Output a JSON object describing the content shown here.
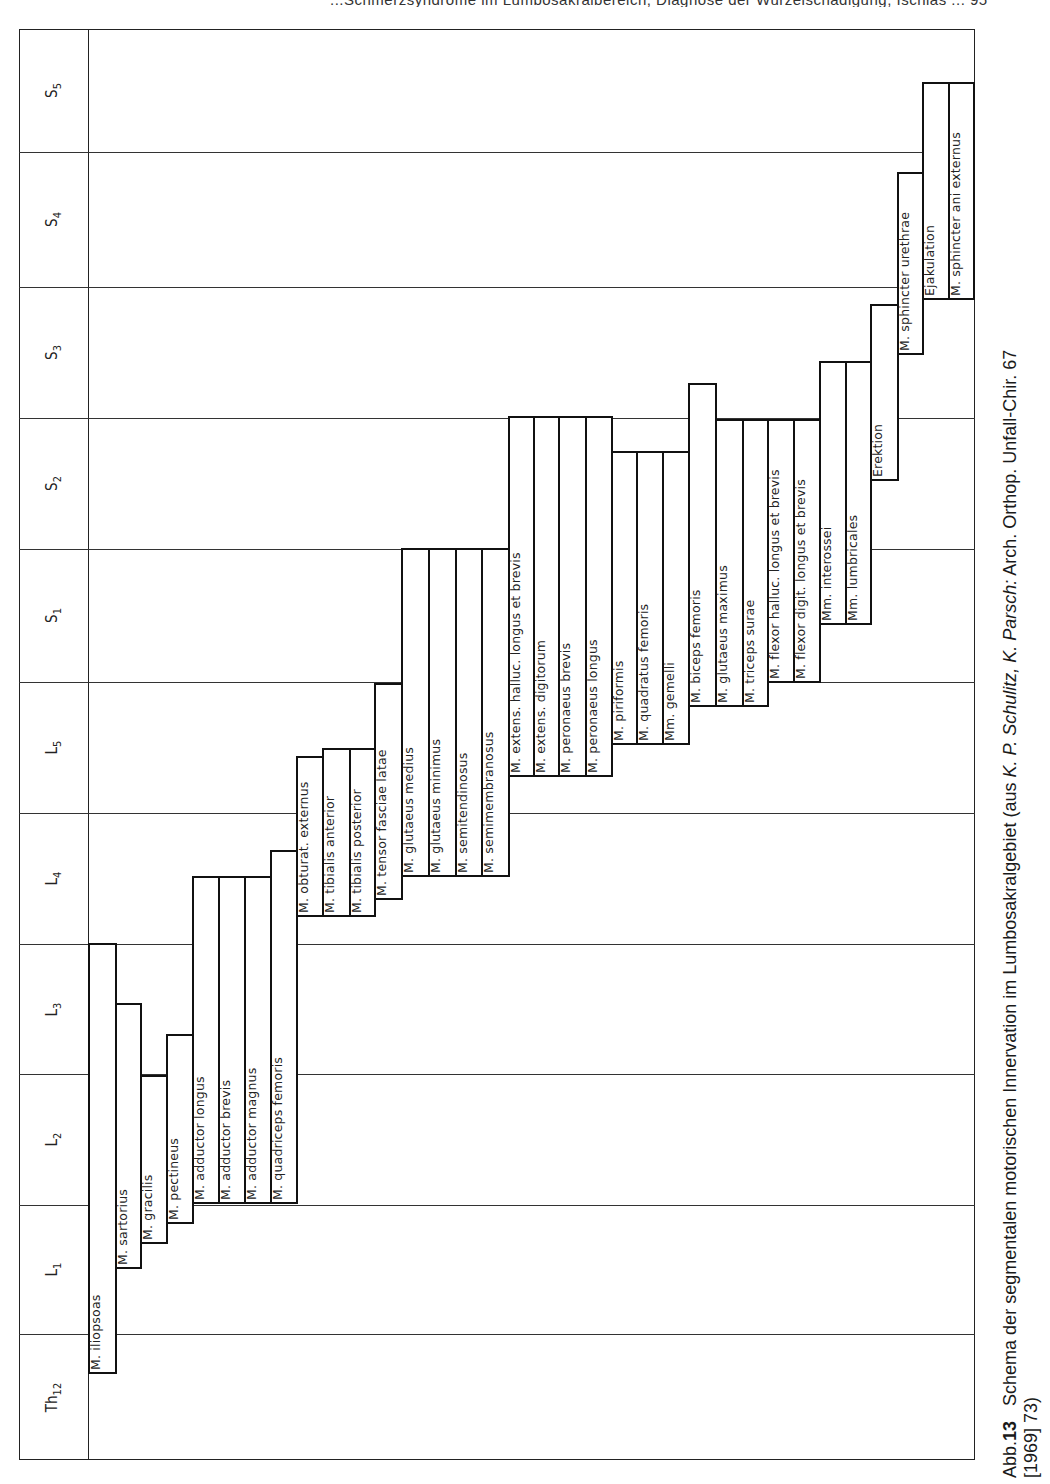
{
  "header": {
    "partial_text": "...Schmerzsyndrome im Lumbosakralbereich, Diagnose der Wurzelschädigung, Ischias ... 95"
  },
  "frame": {
    "left": 19,
    "top": 29,
    "right": 975,
    "bottom": 1460,
    "label_col_right": 88
  },
  "segments": [
    {
      "id": "S5",
      "base": "S",
      "sub": "5",
      "top": 29,
      "bottom": 152
    },
    {
      "id": "S4",
      "base": "S",
      "sub": "4",
      "top": 152,
      "bottom": 287
    },
    {
      "id": "S3",
      "base": "S",
      "sub": "3",
      "top": 287,
      "bottom": 418
    },
    {
      "id": "S2",
      "base": "S",
      "sub": "2",
      "top": 418,
      "bottom": 549
    },
    {
      "id": "S1",
      "base": "S",
      "sub": "1",
      "top": 549,
      "bottom": 682
    },
    {
      "id": "L5",
      "base": "L",
      "sub": "5",
      "top": 682,
      "bottom": 813
    },
    {
      "id": "L4",
      "base": "L",
      "sub": "4",
      "top": 813,
      "bottom": 944
    },
    {
      "id": "L3",
      "base": "L",
      "sub": "3",
      "top": 944,
      "bottom": 1074
    },
    {
      "id": "L2",
      "base": "L",
      "sub": "2",
      "top": 1074,
      "bottom": 1205
    },
    {
      "id": "L1",
      "base": "L",
      "sub": "1",
      "top": 1205,
      "bottom": 1334
    },
    {
      "id": "Th12",
      "base": "Th",
      "sub": "12",
      "top": 1334,
      "bottom": 1460
    }
  ],
  "chart_data": {
    "type": "table",
    "title": "Schema der segmentalen motorischen Innervation im Lumbosakralgebiet",
    "axis": "Rückenmarkssegmente (Th12 unten bis S5 oben)",
    "segments_order": [
      "Th12",
      "L1",
      "L2",
      "L3",
      "L4",
      "L5",
      "S1",
      "S2",
      "S3",
      "S4",
      "S5"
    ],
    "muscles": [
      {
        "name": "M. iliopsoas",
        "x": 88,
        "w": 27,
        "top": 943,
        "bottom": 1374,
        "from": "Th12",
        "to": "L3"
      },
      {
        "name": "M. sartorius",
        "x": 115,
        "w": 25,
        "top": 1003,
        "bottom": 1269,
        "from": "L1",
        "to": "L3"
      },
      {
        "name": "M. gracilis",
        "x": 140,
        "w": 26,
        "top": 1075,
        "bottom": 1244,
        "from": "L1",
        "to": "L2"
      },
      {
        "name": "M. pectineus",
        "x": 166,
        "w": 26,
        "top": 1034,
        "bottom": 1224,
        "from": "L1",
        "to": "L3"
      },
      {
        "name": "M. adductor longus",
        "x": 192,
        "w": 26,
        "top": 876,
        "bottom": 1204,
        "from": "L2",
        "to": "L4"
      },
      {
        "name": "M. adductor brevis",
        "x": 218,
        "w": 26,
        "top": 876,
        "bottom": 1204,
        "from": "L2",
        "to": "L4"
      },
      {
        "name": "M. adductor magnus",
        "x": 244,
        "w": 26,
        "top": 876,
        "bottom": 1204,
        "from": "L2",
        "to": "L4"
      },
      {
        "name": "M. quadriceps femoris",
        "x": 270,
        "w": 26,
        "top": 850,
        "bottom": 1204,
        "from": "L2",
        "to": "L4"
      },
      {
        "name": "M. obturat. externus",
        "x": 296,
        "w": 26,
        "top": 756,
        "bottom": 917,
        "from": "L3",
        "to": "L5"
      },
      {
        "name": "M. tibialis anterior",
        "x": 322,
        "w": 27,
        "top": 748,
        "bottom": 917,
        "from": "L3",
        "to": "L5"
      },
      {
        "name": "M. tibialis posterior",
        "x": 349,
        "w": 25,
        "top": 748,
        "bottom": 917,
        "from": "L3",
        "to": "L5"
      },
      {
        "name": "M. tensor fasciae latae",
        "x": 374,
        "w": 27,
        "top": 683,
        "bottom": 900,
        "from": "L4",
        "to": "L5"
      },
      {
        "name": "M. glutaeus medius",
        "x": 401,
        "w": 27,
        "top": 548,
        "bottom": 877,
        "from": "L4",
        "to": "S1"
      },
      {
        "name": "M. glutaeus minimus",
        "x": 428,
        "w": 27,
        "top": 548,
        "bottom": 877,
        "from": "L4",
        "to": "S1"
      },
      {
        "name": "M. semitendinosus",
        "x": 455,
        "w": 26,
        "top": 548,
        "bottom": 877,
        "from": "L4",
        "to": "S1"
      },
      {
        "name": "M. semimembranosus",
        "x": 481,
        "w": 27,
        "top": 548,
        "bottom": 877,
        "from": "L4",
        "to": "S1"
      },
      {
        "name": "M. extens. halluc. longus et brevis",
        "x": 508,
        "w": 25,
        "top": 416,
        "bottom": 777,
        "from": "L5",
        "to": "S2"
      },
      {
        "name": "M. extens. digitorum",
        "x": 533,
        "w": 25,
        "top": 416,
        "bottom": 777,
        "from": "L5",
        "to": "S2"
      },
      {
        "name": "M. peronaeus brevis",
        "x": 558,
        "w": 27,
        "top": 416,
        "bottom": 777,
        "from": "L5",
        "to": "S2"
      },
      {
        "name": "M. peronaeus longus",
        "x": 585,
        "w": 26,
        "top": 416,
        "bottom": 777,
        "from": "L5",
        "to": "S2"
      },
      {
        "name": "M. piriformis",
        "x": 611,
        "w": 25,
        "top": 451,
        "bottom": 745,
        "from": "L5",
        "to": "S2"
      },
      {
        "name": "M. quadratus femoris",
        "x": 636,
        "w": 26,
        "top": 451,
        "bottom": 745,
        "from": "L5",
        "to": "S2"
      },
      {
        "name": "Mm. gemelli",
        "x": 662,
        "w": 26,
        "top": 451,
        "bottom": 745,
        "from": "L5",
        "to": "S2"
      },
      {
        "name": "M. biceps femoris",
        "x": 688,
        "w": 27,
        "top": 383,
        "bottom": 707,
        "from": "L5",
        "to": "S3"
      },
      {
        "name": "M. glutaeus maximus",
        "x": 715,
        "w": 27,
        "top": 419,
        "bottom": 707,
        "from": "L5",
        "to": "S2"
      },
      {
        "name": "M. triceps surae",
        "x": 742,
        "w": 25,
        "top": 419,
        "bottom": 707,
        "from": "L5",
        "to": "S2"
      },
      {
        "name": "M. flexor halluc. longus et brevis",
        "x": 767,
        "w": 26,
        "top": 419,
        "bottom": 683,
        "from": "S1",
        "to": "S2"
      },
      {
        "name": "M. flexor digit. longus et brevis",
        "x": 793,
        "w": 26,
        "top": 419,
        "bottom": 683,
        "from": "S1",
        "to": "S2"
      },
      {
        "name": "Mm. interossei",
        "x": 819,
        "w": 26,
        "top": 361,
        "bottom": 625,
        "from": "S1",
        "to": "S3"
      },
      {
        "name": "Mm. lumbricales",
        "x": 845,
        "w": 25,
        "top": 361,
        "bottom": 625,
        "from": "S1",
        "to": "S3"
      },
      {
        "name": "Erektion",
        "x": 870,
        "w": 27,
        "top": 304,
        "bottom": 481,
        "from": "S2",
        "to": "S3"
      },
      {
        "name": "M. sphincter urethrae",
        "x": 897,
        "w": 25,
        "top": 172,
        "bottom": 355,
        "from": "S3",
        "to": "S4"
      },
      {
        "name": "Ejakulation",
        "x": 922,
        "w": 26,
        "top": 82,
        "bottom": 300,
        "from": "S4",
        "to": "S5"
      },
      {
        "name": "M. sphincter ani externus",
        "x": 948,
        "w": 25,
        "top": 82,
        "bottom": 300,
        "from": "S4",
        "to": "S5"
      }
    ]
  },
  "caption": {
    "prefix": "Abb.",
    "number": "13",
    "text": "Schema der segmentalen motorischen Innervation im Lumbosakralgebiet (aus",
    "authors": "K. P. Schulitz, K. Parsch:",
    "source": "Arch. Orthop. Unfall-Chir. 67",
    "line2": "[1969] 73)"
  }
}
